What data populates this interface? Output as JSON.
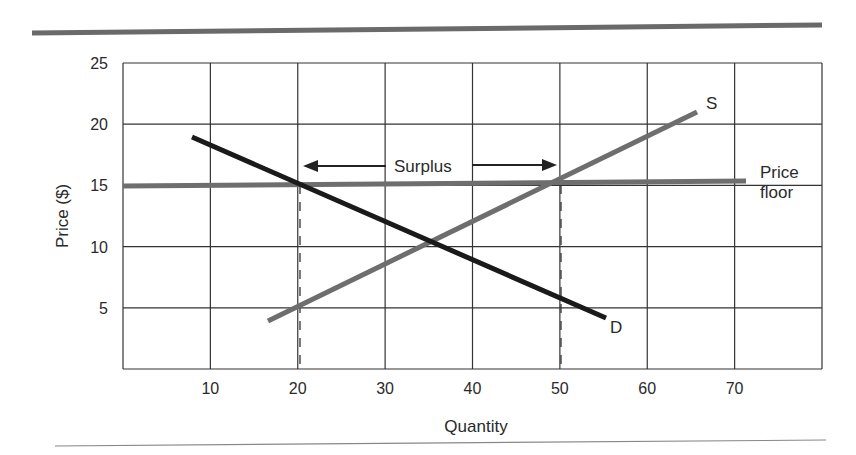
{
  "chart_data": {
    "type": "line",
    "title": "",
    "xlabel": "Quantity",
    "ylabel": "Price ($)",
    "xlim": [
      0,
      80
    ],
    "ylim": [
      0,
      25
    ],
    "x_ticks": [
      "10",
      "20",
      "30",
      "40",
      "50",
      "60",
      "70"
    ],
    "y_ticks": [
      "5",
      "10",
      "15",
      "20",
      "25"
    ],
    "grid": true,
    "series": [
      {
        "name": "D",
        "label": "D",
        "color": "#1a1a1a",
        "points": [
          [
            8,
            19
          ],
          [
            55,
            4
          ]
        ]
      },
      {
        "name": "S",
        "label": "S",
        "color": "#6e6e6e",
        "points": [
          [
            16,
            4
          ],
          [
            65,
            21
          ]
        ]
      },
      {
        "name": "Price floor",
        "label": "Price floor",
        "color": "#6e6e6e",
        "points": [
          [
            0,
            15
          ],
          [
            71,
            15
          ]
        ]
      }
    ],
    "annotations": [
      {
        "text": "Surplus",
        "type": "double-arrow",
        "from": [
          20,
          16.5
        ],
        "to": [
          50,
          16.5
        ]
      },
      {
        "text": "",
        "type": "dashed-vertical",
        "x": 20,
        "y_range": [
          0,
          15
        ]
      },
      {
        "text": "",
        "type": "dashed-vertical",
        "x": 50,
        "y_range": [
          0,
          15
        ]
      }
    ],
    "equilibrium": {
      "quantity": 35,
      "price": 10.5
    },
    "price_floor": 15,
    "quantity_demanded_at_floor": 20,
    "quantity_supplied_at_floor": 50
  },
  "labels": {
    "price_floor_line1": "Price",
    "price_floor_line2": "floor",
    "surplus": "Surplus",
    "supply": "S",
    "demand": "D",
    "x_axis": "Quantity",
    "y_axis": "Price ($)"
  }
}
